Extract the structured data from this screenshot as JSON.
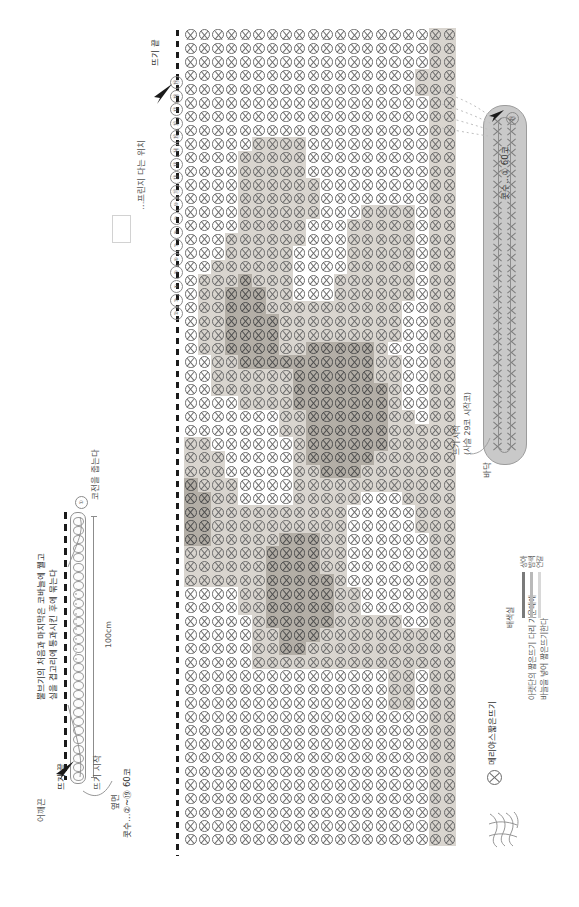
{
  "document": {
    "type": "crochet-pattern-chart",
    "orientation": "rotated-90"
  },
  "body_chart": {
    "name": "본체 (body)",
    "start_label": "뜨기 시작",
    "end_label": "뜨기 끝",
    "stitch_count_label": "콧수…②~⑲ 60코",
    "side_label": "옆면",
    "fringe_note": "…프린지 다는 위치",
    "row_numbers": [
      "⑲",
      "⑱",
      "⑰",
      "⑯",
      "⑮",
      "⑭",
      "⑬",
      "⑫",
      "⑪",
      "⑩",
      "⑨",
      "⑧",
      "⑦",
      "⑥",
      "⑤",
      "④",
      "③",
      "②"
    ],
    "rows": 20,
    "cols": 60,
    "colors": {
      "ivory": "#ffffff",
      "light": "#d9d5cf",
      "dark": "#b3aea6",
      "outline": "#6b6b6b"
    }
  },
  "strap": {
    "name": "어깨끈",
    "label": "어깨끈",
    "start_label": "뜨기 시작",
    "end_label": "뜨기 끝",
    "length": "100cm",
    "stitch_count_label": "콧수…②~⑲ 60코",
    "round_number": "①",
    "note": "뿔브기의 처음과 마지막은 코바늘에 꿸고\n실을 겹고리에 통과시킨 후에 묶는다",
    "note_line1": "뿔브기의 처음과 마지막은 코바늘에 꿸고",
    "note_line2": "실을 겹고리에 통과시킨 후에 묶는다",
    "cord_note": "코전을 줍는다"
  },
  "bottom_piece": {
    "name": "바닥",
    "label": "바닥",
    "start_label": "뜨기 시작",
    "start_sub": "(사슬 29코 시작코)",
    "stitch_count_label": "콧수…① 60코",
    "round_number": "⑲"
  },
  "legend": {
    "symbol_name": "x-circle-icon",
    "symbol_label": "메리야스짧은뜨기",
    "symbol_desc_line1": "아랫단의 짧은뜨기 다리 가운데에",
    "symbol_desc_line2": "바늘을 넣어 짧은뜨기한다",
    "color_header": "배색실",
    "colors": [
      {
        "name": "상아",
        "swatch": "#d8d8d8"
      },
      {
        "name": "밤색",
        "swatch": "#b9b9b9"
      },
      {
        "name": "연갈",
        "swatch": "#7a7a7a"
      }
    ]
  }
}
